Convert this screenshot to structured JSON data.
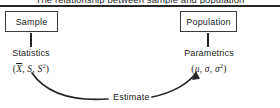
{
  "figure": {
    "caption": "The relationship between sample and population",
    "accent_color": "#262626",
    "background_color": "#ffffff",
    "box_border_color": "#3a3a3a"
  },
  "nodes": {
    "sample": {
      "label": "Sample",
      "detail_title": "Statistics",
      "detail_symbols": "(X̄, S, S²)",
      "symbol_parts": {
        "open": "(",
        "mean": "X",
        "sd": "S",
        "variance_base": "S",
        "variance_exp": "2",
        "close": ")",
        "sep1": ", ",
        "sep2": ", "
      }
    },
    "population": {
      "label": "Population",
      "detail_title": "Parametrics",
      "detail_symbols": "(μ, σ, σ²)",
      "symbol_parts": {
        "open": "(",
        "mean": "μ",
        "sd": "σ",
        "variance_base": "σ",
        "variance_exp": "2",
        "close": ")",
        "sep1": ", ",
        "sep2": ", "
      }
    }
  },
  "arrow": {
    "label": "Estimate",
    "direction": "sample-to-population"
  }
}
